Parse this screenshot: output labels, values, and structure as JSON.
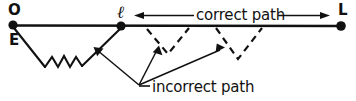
{
  "figure": {
    "type": "physics-path-diagram",
    "background_color": "#ffffff",
    "stroke_color": "#111111",
    "nodes": [
      {
        "id": "O",
        "label": "O",
        "x": 13,
        "y": 25
      },
      {
        "id": "l",
        "label": "ℓ",
        "x": 121,
        "y": 25
      },
      {
        "id": "L",
        "label": "L",
        "x": 341,
        "y": 26
      }
    ],
    "extra_labels": [
      {
        "id": "E",
        "label": "E"
      }
    ],
    "annotations": [
      {
        "id": "correct",
        "label": "correct path",
        "arrow_left": true,
        "arrow_right": true
      },
      {
        "id": "incorrect",
        "label": "incorrect path",
        "arrow_count": 3
      }
    ]
  }
}
